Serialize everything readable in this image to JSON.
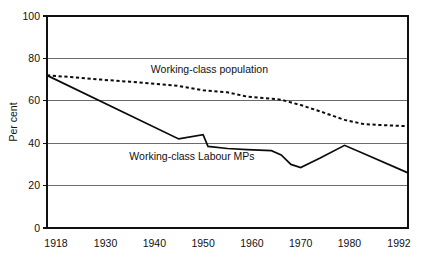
{
  "chart_data": {
    "type": "line",
    "title": "",
    "xlabel": "",
    "ylabel": "Per cent",
    "xlim": [
      1918,
      1992
    ],
    "ylim": [
      0,
      100
    ],
    "grid": true,
    "legend_position": "inline-annotations",
    "xticks": [
      1918,
      1930,
      1940,
      1950,
      1960,
      1970,
      1980,
      1992
    ],
    "xtick_labels": [
      "1918",
      "1930",
      "1940",
      "1950",
      "1960",
      "1970",
      "1980",
      "1992"
    ],
    "yticks": [
      0,
      20,
      40,
      60,
      80,
      100
    ],
    "ytick_labels": [
      "0",
      "20",
      "40",
      "60",
      "80",
      "100"
    ],
    "series": [
      {
        "name": "Working-class population",
        "style": "dotted",
        "label_text": "Working-class population",
        "x": [
          1918,
          1924,
          1929,
          1935,
          1945,
          1950,
          1955,
          1959,
          1964,
          1966,
          1970,
          1974,
          1979,
          1983,
          1987,
          1992
        ],
        "values": [
          72,
          71,
          70,
          69,
          67,
          65,
          64,
          62,
          61,
          60.5,
          58,
          55,
          51,
          49,
          48.5,
          48
        ]
      },
      {
        "name": "Working-class Labour MPs",
        "style": "solid",
        "label_text": "Working-class Labour MPs",
        "x": [
          1918,
          1945,
          1950,
          1951,
          1955,
          1959,
          1964,
          1966,
          1968,
          1970,
          1974,
          1979,
          1983,
          1992
        ],
        "values": [
          72,
          42,
          44,
          38.5,
          37.5,
          37,
          36.5,
          34.5,
          30,
          28.5,
          33,
          39,
          35,
          26
        ]
      }
    ],
    "annotations": [
      {
        "text": "Working-class population",
        "x": 1952,
        "y": 73
      },
      {
        "text": "Working-class Labour MPs",
        "x": 1948,
        "y": 32
      }
    ],
    "colors": {
      "line": "#0b0b0b",
      "gridline": "#6b6b6b",
      "frame": "#111111",
      "background": "#ffffff"
    }
  }
}
